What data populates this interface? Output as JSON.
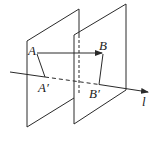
{
  "figure": {
    "labels": {
      "A": "A",
      "B": "B",
      "A_prime": "A′",
      "B_prime": "B′",
      "l": "l"
    },
    "colors": {
      "stroke": "#2a2a2a",
      "background": "#ffffff"
    }
  }
}
